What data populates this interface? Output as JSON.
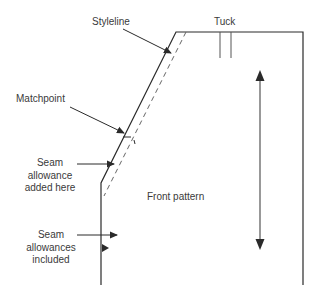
{
  "diagram": {
    "labels": {
      "styleline": "Styleline",
      "tuck": "Tuck",
      "matchpoint": "Matchpoint",
      "seam_added_line1": "Seam",
      "seam_added_line2": "allowance",
      "seam_added_line3": "added here",
      "front_pattern": "Front pattern",
      "seam_included_line1": "Seam",
      "seam_included_line2": "allowances",
      "seam_included_line3": "included"
    },
    "colors": {
      "line": "#2a2a2a",
      "dashed": "#666666",
      "text": "#3a3a3a"
    }
  }
}
